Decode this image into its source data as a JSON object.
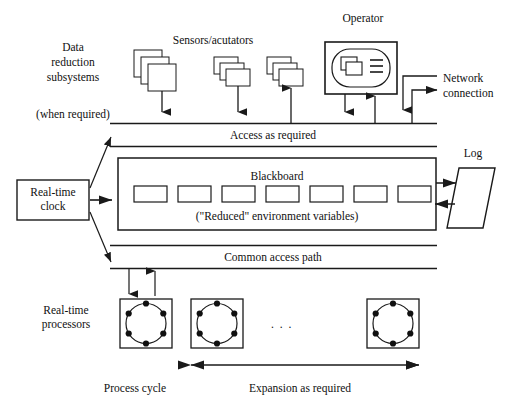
{
  "diagram": {
    "title_labels": {
      "data_reduction": [
        "Data",
        "reduction",
        "subsystems"
      ],
      "when_required": "(when required)",
      "sensors": "Sensors/acutators",
      "operator": "Operator",
      "network": [
        "Network",
        "connection"
      ],
      "log": "Log",
      "blackboard": "Blackboard",
      "reduced_vars": "(\"Reduced\" environment variables)",
      "access_bus": "Access as required",
      "common_path": "Common access path",
      "realtime_clock": [
        "Real-time",
        "clock"
      ],
      "realtime_processors": [
        "Real-time",
        "processors"
      ],
      "process_cycle": "Process cycle",
      "expansion": "Expansion as required",
      "ellipsis": ". . ."
    },
    "blackboard_cells": 7,
    "processor_count": 3,
    "processor_pins": 6,
    "sensor_stacks": 3,
    "colors": {
      "stroke": "#1a1a1a",
      "fill": "#ffffff",
      "text": "#101010"
    }
  }
}
